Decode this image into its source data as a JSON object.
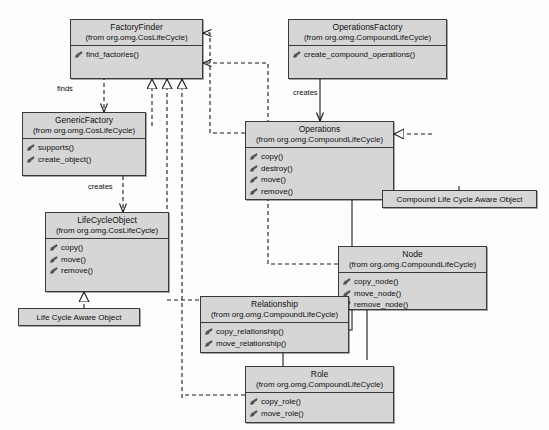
{
  "diagram": {
    "type": "uml-class-diagram"
  },
  "classes": [
    {
      "id": "factoryfinder",
      "name": "FactoryFinder",
      "package": "(from org.omg.CosLifeCycle)",
      "operations": [
        "find_factories()"
      ]
    },
    {
      "id": "operationsfactory",
      "name": "OperationsFactory",
      "package": "(from org.omg.CompoundLifeCycle)",
      "operations": [
        "create_compound_operations()"
      ]
    },
    {
      "id": "genericfactory",
      "name": "GenericFactory",
      "package": "(from org.omg.CosLifeCycle)",
      "operations": [
        "supports()",
        "create_object()"
      ]
    },
    {
      "id": "operations",
      "name": "Operations",
      "package": "(from org.omg.CompoundLifeCycle)",
      "operations": [
        "copy()",
        "destroy()",
        "move()",
        "remove()"
      ]
    },
    {
      "id": "lifecycleobject",
      "name": "LifeCycleObject",
      "package": "(from org.omg.CosLifeCycle)",
      "operations": [
        "copy()",
        "move()",
        "remove()"
      ]
    },
    {
      "id": "node",
      "name": "Node",
      "package": "(from org.omg.CompoundLifeCycle)",
      "operations": [
        "copy_node()",
        "move_node()",
        "remove_node()"
      ]
    },
    {
      "id": "relationship",
      "name": "Relationship",
      "package": "(from org.omg.CompoundLifeCycle)",
      "operations": [
        "copy_relationship()",
        "move_relationship()"
      ]
    },
    {
      "id": "role",
      "name": "Role",
      "package": "(from org.omg.CompoundLifeCycle)",
      "operations": [
        "copy_role()",
        "move_role()"
      ]
    }
  ],
  "notes": [
    {
      "id": "note-compound",
      "text": "Compound Life Cycle Aware Object"
    },
    {
      "id": "note-plain",
      "text": "Life Cycle Aware Object"
    }
  ],
  "edge_labels": {
    "finds": "finds",
    "creates_left": "creates",
    "creates_right": "creates"
  },
  "colors": {
    "box_fill": "#d6d6d6",
    "box_border": "#3a3a3a",
    "line": "#1a1a1a",
    "text": "#101010",
    "page_bg": "#fdfdfd"
  },
  "icons": {
    "operation": "method-icon"
  }
}
